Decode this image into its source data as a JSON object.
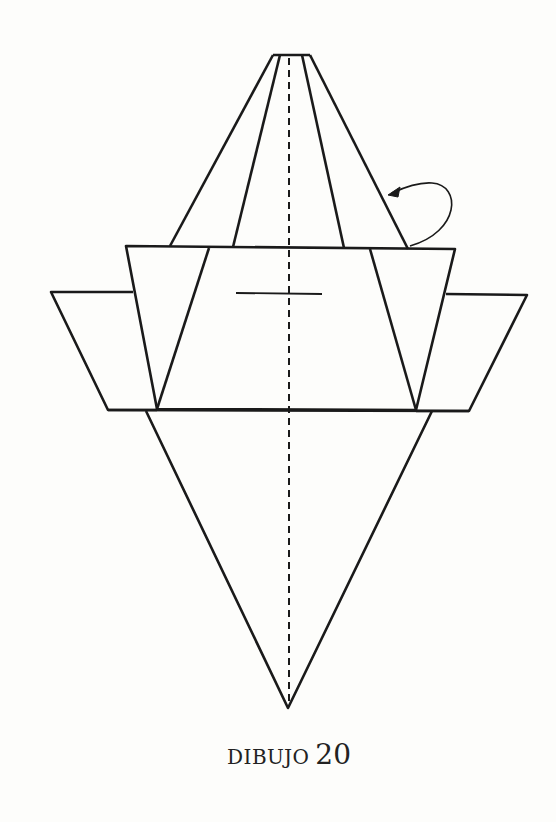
{
  "diagram": {
    "caption_word": "DIBUJO",
    "caption_number": "20",
    "stroke_color": "#1a1a1a",
    "background_color": "#fdfdfb",
    "elements": [
      "upper-trapezoid-flap",
      "center-rectangle-panel",
      "left-side-flap",
      "right-side-flap",
      "lower-triangle",
      "center-valley-fold-line",
      "rotate-arrow",
      "center-mark-line"
    ]
  }
}
